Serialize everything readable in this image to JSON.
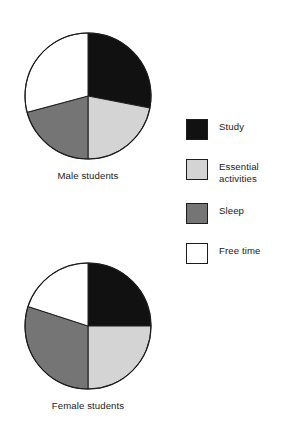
{
  "figure": {
    "title": "",
    "background": "#ffffff"
  },
  "colors": {
    "study": "#111111",
    "essential": "#d4d4d4",
    "sleep": "#757575",
    "free": "#ffffff",
    "outline": "#1c1c1c",
    "text": "#1a1a1a"
  },
  "legend": {
    "position": "right",
    "items": [
      {
        "label": "Study",
        "label_line2": "",
        "color": "#111111",
        "key": "study"
      },
      {
        "label": "Essential",
        "label_line2": "activities",
        "color": "#d4d4d4",
        "key": "essential"
      },
      {
        "label": "Sleep",
        "label_line2": "",
        "color": "#757575",
        "key": "sleep"
      },
      {
        "label": "Free time",
        "label_line2": "",
        "color": "#ffffff",
        "key": "free"
      }
    ]
  },
  "charts": {
    "male": {
      "caption": "Male students",
      "center": {
        "x": 68,
        "y": 68
      },
      "radius": 63,
      "slices": [
        {
          "label": "Study",
          "value": 28,
          "color": "#111111",
          "start_deg": 0,
          "end_deg": 101
        },
        {
          "label": "Essential activities",
          "value": 22,
          "color": "#d4d4d4",
          "start_deg": 101,
          "end_deg": 180
        },
        {
          "label": "Sleep",
          "value": 21,
          "color": "#757575",
          "start_deg": 180,
          "end_deg": 255
        },
        {
          "label": "Free time",
          "value": 29,
          "color": "#ffffff",
          "start_deg": 255,
          "end_deg": 360
        }
      ]
    },
    "female": {
      "caption": "Female students",
      "center": {
        "x": 68,
        "y": 68
      },
      "radius": 63,
      "slices": [
        {
          "label": "Study",
          "value": 25,
          "color": "#111111",
          "start_deg": 0,
          "end_deg": 90
        },
        {
          "label": "Essential activities",
          "value": 25,
          "color": "#d4d4d4",
          "start_deg": 90,
          "end_deg": 180
        },
        {
          "label": "Sleep",
          "value": 30,
          "color": "#757575",
          "start_deg": 180,
          "end_deg": 288
        },
        {
          "label": "Free time",
          "value": 20,
          "color": "#ffffff",
          "start_deg": 288,
          "end_deg": 360
        }
      ]
    }
  },
  "chart_data": {
    "type": "pie",
    "title": "",
    "xlabel": "",
    "ylabel": "",
    "grid": false,
    "legend_position": "right",
    "categories": [
      "Study",
      "Essential activities",
      "Sleep",
      "Free time"
    ],
    "slice_colors": [
      "#111111",
      "#d4d4d4",
      "#757575",
      "#ffffff"
    ],
    "series": [
      {
        "name": "Male students",
        "values": [
          28,
          22,
          21,
          29
        ]
      },
      {
        "name": "Female students",
        "values": [
          25,
          25,
          30,
          20
        ]
      }
    ],
    "units": "percent of day",
    "annotations": [
      "Male students",
      "Female students"
    ]
  }
}
